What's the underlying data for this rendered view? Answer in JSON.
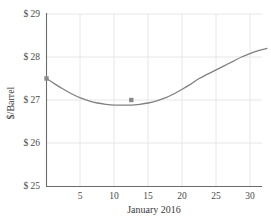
{
  "chart_data": {
    "type": "line",
    "title": "",
    "subtitle": "",
    "xlabel": "January 2016",
    "ylabel": "$/Barrel",
    "xlim": [
      0,
      32.5
    ],
    "ylim": [
      25,
      29
    ],
    "grid": true,
    "legend": null,
    "legend_position": "none",
    "x_ticks": [
      5,
      10,
      15,
      20,
      25,
      30
    ],
    "x_tick_labels": [
      "5",
      "10",
      "15",
      "20",
      "25",
      "30"
    ],
    "y_ticks": [
      25,
      26,
      27,
      28,
      29
    ],
    "y_tick_labels": [
      "$ 25",
      "$ 26",
      "$ 27",
      "$ 28",
      "$ 29"
    ],
    "series": [
      {
        "name": "Oil price",
        "color": "#808080",
        "x": [
          0,
          1.25,
          2.5,
          3.75,
          5,
          6.25,
          7.5,
          8.75,
          10,
          11.25,
          12.5,
          13.75,
          15,
          16.25,
          17.5,
          18.75,
          20,
          21.25,
          22.5,
          23.75,
          25,
          26.25,
          27.5,
          28.75,
          30,
          31.25,
          32.5
        ],
        "y": [
          27.5,
          27.37,
          27.25,
          27.14,
          27.05,
          26.98,
          26.93,
          26.9,
          26.88,
          26.88,
          26.88,
          26.9,
          26.93,
          26.98,
          27.05,
          27.14,
          27.25,
          27.37,
          27.5,
          27.6,
          27.7,
          27.8,
          27.9,
          28.0,
          28.08,
          28.15,
          28.2
        ]
      }
    ],
    "markers": [
      {
        "label": "start-point",
        "x": 0,
        "y": 27.5
      },
      {
        "label": "minimum-point",
        "x": 12.5,
        "y": 27.0
      }
    ],
    "colors": {
      "curve": "#808080",
      "axis": "#6b6b6b",
      "grid": "#e3e3e3",
      "text": "#3a3a3a",
      "background": "#ffffff"
    }
  }
}
